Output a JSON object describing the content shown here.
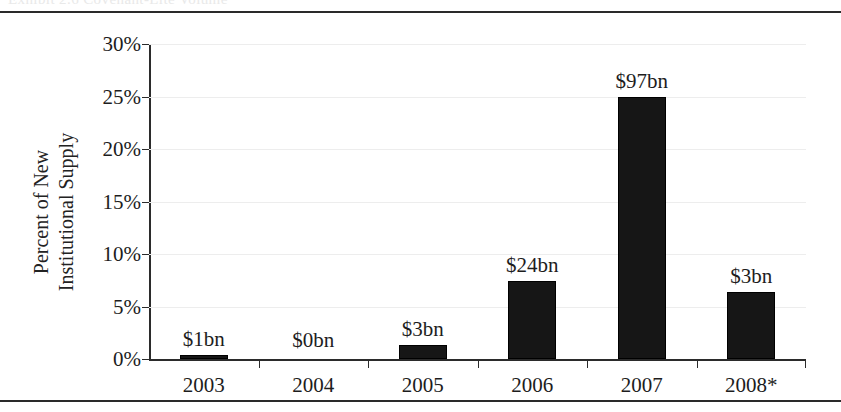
{
  "page": {
    "clipped_header_text": "Exhibit 2.6    Covenant-Lite Volume"
  },
  "chart_data": {
    "type": "bar",
    "title": "",
    "xlabel": "",
    "ylabel": "Percent of New\nInstitutional Supply",
    "categories": [
      "2003",
      "2004",
      "2005",
      "2006",
      "2007",
      "2008*"
    ],
    "values": [
      0.4,
      0.0,
      1.3,
      7.4,
      25.0,
      6.4
    ],
    "point_labels": [
      "$1bn",
      "$0bn",
      "$3bn",
      "$24bn",
      "$97bn",
      "$3bn"
    ],
    "ylim": [
      0,
      30
    ],
    "ytick_values": [
      0,
      5,
      10,
      15,
      20,
      25,
      30
    ],
    "ytick_labels": [
      "0%",
      "5%",
      "10%",
      "15%",
      "20%",
      "25%",
      "30%"
    ],
    "grid": true,
    "legend": "none",
    "bar_color": "#161616",
    "gridline_color": "#ededed",
    "axis_color": "#2b2b2b"
  }
}
